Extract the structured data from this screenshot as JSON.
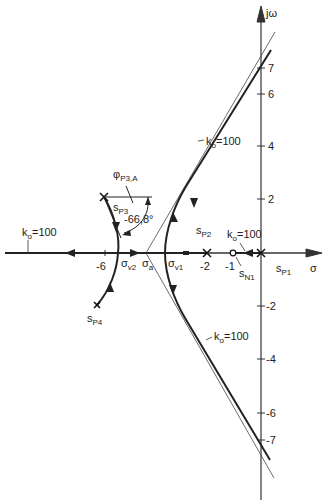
{
  "diagram": {
    "type": "root-locus",
    "axes": {
      "x_label": "σ",
      "y_label": "jω",
      "x_ticks": [
        {
          "value": -6,
          "label": "-6"
        },
        {
          "value": -2,
          "label": "-2"
        },
        {
          "value": -1,
          "label": "-1"
        }
      ],
      "y_ticks": [
        {
          "value": 7,
          "label": "7"
        },
        {
          "value": 6,
          "label": "6"
        },
        {
          "value": 4,
          "label": "4"
        },
        {
          "value": 2,
          "label": "2"
        },
        {
          "value": -2,
          "label": "-2"
        },
        {
          "value": -4,
          "label": "-4"
        },
        {
          "value": -6,
          "label": "-6"
        },
        {
          "value": -7,
          "label": "-7"
        }
      ]
    },
    "poles": [
      {
        "name": "s",
        "sub": "P1",
        "re": 0,
        "im": 0
      },
      {
        "name": "s",
        "sub": "P2",
        "re": -2,
        "im": 0
      },
      {
        "name": "s",
        "sub": "P3",
        "re": -6.1,
        "im": 2.1
      },
      {
        "name": "s",
        "sub": "P4",
        "re": -6.3,
        "im": -2.0
      }
    ],
    "zeros": [
      {
        "name": "s",
        "sub": "N1",
        "re": -1,
        "im": 0
      }
    ],
    "points": [
      {
        "name": "σ",
        "sub": "a",
        "re": -4.4
      },
      {
        "name": "σ",
        "sub": "v1",
        "re": -3.7
      },
      {
        "name": "σ",
        "sub": "v2",
        "re": -5.5
      }
    ],
    "gain_labels": [
      {
        "text": "k",
        "sub": "o",
        "value": "=100",
        "where": "upper-asymptote"
      },
      {
        "text": "k",
        "sub": "o",
        "value": "=100",
        "where": "lower-asymptote"
      },
      {
        "text": "k",
        "sub": "o",
        "value": "=100",
        "where": "real-axis-left"
      },
      {
        "text": "k",
        "sub": "o",
        "value": "=100",
        "where": "real-axis-near-zero"
      }
    ],
    "angle": {
      "symbol": "φ",
      "sub": "P3,A",
      "value": "-66,8°"
    }
  }
}
